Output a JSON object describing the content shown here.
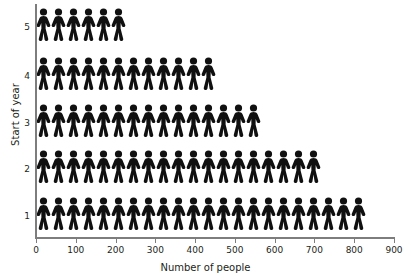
{
  "chart_data": {
    "type": "bar",
    "subtype": "pictogram",
    "title": "",
    "xlabel": "Number of people",
    "ylabel": "Start of year",
    "orientation": "horizontal",
    "categories": [
      "1",
      "2",
      "3",
      "4",
      "5"
    ],
    "values": [
      825,
      713,
      563,
      450,
      225
    ],
    "icon_count": [
      22,
      19,
      15,
      12,
      6
    ],
    "icon_value": 37.5,
    "icon_name": "person-icon",
    "icon_color": "#101010",
    "xlim": [
      0,
      900
    ],
    "ylim_categories": [
      "1",
      "2",
      "3",
      "4",
      "5"
    ],
    "x_ticks": [
      0,
      100,
      200,
      300,
      400,
      500,
      600,
      700,
      800,
      900
    ],
    "x_tick_labels": [
      "0",
      "100",
      "200",
      "300",
      "400",
      "500",
      "600",
      "700",
      "800",
      "900"
    ],
    "y_tick_labels": [
      "5",
      "4",
      "3",
      "2",
      "1"
    ],
    "grid": false,
    "legend": false,
    "axis_color": "#7d7d7d",
    "text_color": "#231f20",
    "background": "#ffffff",
    "series": [
      {
        "name": "Number of people",
        "categories": [
          "1",
          "2",
          "3",
          "4",
          "5"
        ],
        "values": [
          825,
          713,
          563,
          450,
          225
        ]
      }
    ],
    "rows": [
      {
        "label": "5",
        "icons": 6,
        "value": 225,
        "top": 8
      },
      {
        "label": "4",
        "icons": 12,
        "value": 450,
        "top": 57
      },
      {
        "label": "3",
        "icons": 15,
        "value": 563,
        "top": 104
      },
      {
        "label": "2",
        "icons": 19,
        "value": 713,
        "top": 150
      },
      {
        "label": "1",
        "icons": 22,
        "value": 825,
        "top": 197
      }
    ]
  }
}
